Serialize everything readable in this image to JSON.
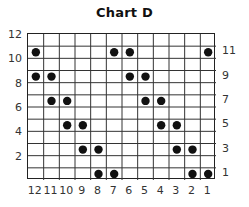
{
  "chart_data": {
    "type": "table",
    "title": "Chart D",
    "columns": 12,
    "rows": 12,
    "x_tick_labels": [
      "12",
      "11",
      "10",
      "9",
      "8",
      "7",
      "6",
      "5",
      "4",
      "3",
      "2",
      "1"
    ],
    "y_tick_labels_left": [
      "12",
      "10",
      "8",
      "6",
      "4",
      "2"
    ],
    "y_tick_labels_right": [
      "11",
      "9",
      "7",
      "5",
      "3",
      "1"
    ],
    "grid": true,
    "dot_color": "#111111",
    "grid_color": "#333333",
    "dots": [
      {
        "row": 11,
        "cols": [
          12,
          7,
          6,
          1
        ]
      },
      {
        "row": 9,
        "cols": [
          12,
          11,
          6,
          5
        ]
      },
      {
        "row": 7,
        "cols": [
          11,
          10,
          5,
          4
        ]
      },
      {
        "row": 5,
        "cols": [
          10,
          9,
          4,
          3
        ]
      },
      {
        "row": 3,
        "cols": [
          9,
          8,
          3,
          2
        ]
      },
      {
        "row": 1,
        "cols": [
          8,
          7,
          2,
          1
        ]
      }
    ]
  }
}
